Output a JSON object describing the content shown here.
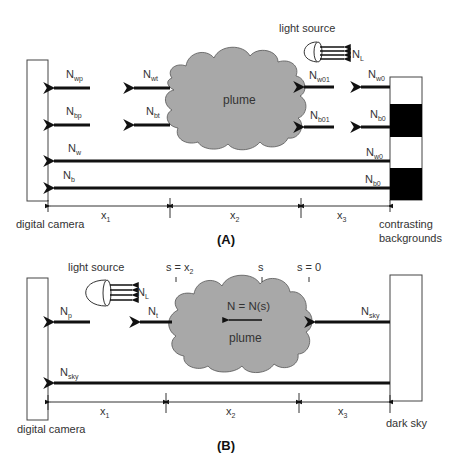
{
  "panel_a": {
    "caption": "(A)",
    "light_source_label": "light source",
    "light_flux": {
      "main": "N",
      "sub": "L"
    },
    "plume_label": "plume",
    "camera_label": "digital camera",
    "background_label_line1": "contrasting",
    "background_label_line2": "backgrounds",
    "arrows": [
      {
        "main": "N",
        "sub": "wp"
      },
      {
        "main": "N",
        "sub": "bp"
      },
      {
        "main": "N",
        "sub": "wt"
      },
      {
        "main": "N",
        "sub": "bt"
      },
      {
        "main": "N",
        "sub": "w01"
      },
      {
        "main": "N",
        "sub": "b01"
      },
      {
        "main": "N",
        "sub": "w0"
      },
      {
        "main": "N",
        "sub": "b0"
      },
      {
        "main": "N",
        "sub": "w"
      },
      {
        "main": "N",
        "sub": "b"
      },
      {
        "main": "N",
        "sub": "w0"
      },
      {
        "main": "N",
        "sub": "b0"
      }
    ],
    "distances": [
      {
        "main": "x",
        "sub": "1"
      },
      {
        "main": "x",
        "sub": "2"
      },
      {
        "main": "x",
        "sub": "3"
      }
    ]
  },
  "panel_b": {
    "caption": "(B)",
    "light_source_label": "light source",
    "light_flux": {
      "main": "N",
      "sub": "L"
    },
    "plume_label": "plume",
    "plume_equation": "N = N(s)",
    "camera_label": "digital camera",
    "sky_label": "dark sky",
    "s_markers": [
      {
        "main": "s = x",
        "sub": "2"
      },
      {
        "main": "s",
        "sub": ""
      },
      {
        "main": "s = 0",
        "sub": ""
      }
    ],
    "arrows": [
      {
        "main": "N",
        "sub": "p"
      },
      {
        "main": "N",
        "sub": "t"
      },
      {
        "main": "N",
        "sub": "sky"
      },
      {
        "main": "N",
        "sub": "sky"
      }
    ],
    "distances": [
      {
        "main": "x",
        "sub": "1"
      },
      {
        "main": "x",
        "sub": "2"
      },
      {
        "main": "x",
        "sub": "3"
      }
    ]
  },
  "colors": {
    "plume_fill": "#a8a8a8",
    "plume_stroke": "#555555",
    "arrow": "#111111",
    "background_black": "#000000",
    "text": "#333333"
  }
}
